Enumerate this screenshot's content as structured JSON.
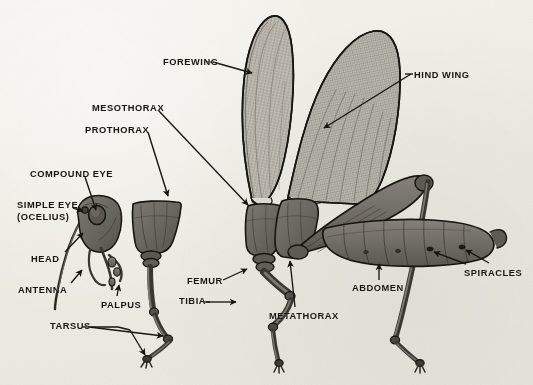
{
  "figure": {
    "kind": "anatomical-diagram",
    "style": "halftone black-and-white textbook plate",
    "background_color": "#f1efe8",
    "ink_color": "#17150f",
    "body_fill": "#6e6a63",
    "body_shadow": "#4a4741",
    "wing_fill": "#b9b6ad",
    "canvas": {
      "width": 533,
      "height": 385
    }
  },
  "labels": [
    {
      "id": "forewing",
      "text": "FOREWING",
      "x": 163,
      "y": 57,
      "lines": 1
    },
    {
      "id": "hind_wing",
      "text": "HIND WING",
      "x": 414,
      "y": 70,
      "lines": 1
    },
    {
      "id": "mesothorax",
      "text": "MESOTHORAX",
      "x": 92,
      "y": 103,
      "lines": 1
    },
    {
      "id": "prothorax",
      "text": "PROTHORAX",
      "x": 85,
      "y": 125,
      "lines": 1
    },
    {
      "id": "compound_eye",
      "text": "COMPOUND EYE",
      "x": 30,
      "y": 169,
      "lines": 1
    },
    {
      "id": "simple_eye",
      "text": "SIMPLE EYE\n(OCELIUS)",
      "x": 17,
      "y": 200,
      "lines": 2
    },
    {
      "id": "head",
      "text": "HEAD",
      "x": 31,
      "y": 254,
      "lines": 1
    },
    {
      "id": "antenna",
      "text": "ANTENNA",
      "x": 18,
      "y": 285,
      "lines": 1
    },
    {
      "id": "palpus",
      "text": "PALPUS",
      "x": 101,
      "y": 300,
      "lines": 1
    },
    {
      "id": "tarsus",
      "text": "TARSUS",
      "x": 50,
      "y": 325,
      "lines": 1
    },
    {
      "id": "femur",
      "text": "FEMUR",
      "x": 187,
      "y": 283,
      "lines": 1
    },
    {
      "id": "tibia",
      "text": "TIBIA",
      "x": 179,
      "y": 299,
      "lines": 1
    },
    {
      "id": "metathorax",
      "text": "METATHORAX",
      "x": 269,
      "y": 313,
      "lines": 1
    },
    {
      "id": "abdomen",
      "text": "ABDOMEN",
      "x": 352,
      "y": 285,
      "lines": 1
    },
    {
      "id": "spiracles",
      "text": "SPIRACLES",
      "x": 464,
      "y": 270,
      "lines": 1
    }
  ],
  "leaders": [
    {
      "id": "forewing-leader",
      "label": "forewing",
      "target": "forewing-blade"
    },
    {
      "id": "hind-wing-leader",
      "label": "hind_wing",
      "target": "hind-wing-blade"
    },
    {
      "id": "mesothorax-leader",
      "label": "mesothorax",
      "target": "mesothorax-segment"
    },
    {
      "id": "prothorax-leader",
      "label": "prothorax",
      "target": "prothorax-segment"
    },
    {
      "id": "compound-eye-leader",
      "label": "compound_eye",
      "target": "compound-eye"
    },
    {
      "id": "simple-eye-leader",
      "label": "simple_eye",
      "target": "simple-eye"
    },
    {
      "id": "head-leader",
      "label": "head",
      "target": "head-capsule"
    },
    {
      "id": "antenna-leader",
      "label": "antenna",
      "target": "antenna"
    },
    {
      "id": "palpus-leader",
      "label": "palpus",
      "target": "palpus"
    },
    {
      "id": "tarsus-leader-a",
      "label": "tarsus",
      "target": "foreleg-tarsus"
    },
    {
      "id": "tarsus-leader-b",
      "label": "tarsus",
      "target": "foreleg-claw"
    },
    {
      "id": "femur-leader",
      "label": "femur",
      "target": "midleg-femur"
    },
    {
      "id": "tibia-leader",
      "label": "tibia",
      "target": "midleg-tibia"
    },
    {
      "id": "metathorax-leader",
      "label": "metathorax",
      "target": "metathorax-segment"
    },
    {
      "id": "abdomen-leader",
      "label": "abdomen",
      "target": "abdomen-segments"
    },
    {
      "id": "spiracles-leader-a",
      "label": "spiracles",
      "target": "spiracle-front"
    },
    {
      "id": "spiracles-leader-b",
      "label": "spiracles",
      "target": "spiracle-rear"
    }
  ],
  "parts": [
    {
      "id": "head-capsule",
      "name": "head",
      "group": "head"
    },
    {
      "id": "compound-eye",
      "name": "compound eye",
      "group": "head"
    },
    {
      "id": "simple-eye",
      "name": "simple eye (ocellus)",
      "group": "head"
    },
    {
      "id": "antenna",
      "name": "antenna",
      "group": "head"
    },
    {
      "id": "palpus",
      "name": "palpus",
      "group": "head"
    },
    {
      "id": "prothorax-segment",
      "name": "prothorax",
      "group": "thorax"
    },
    {
      "id": "foreleg-tarsus",
      "name": "tarsus",
      "group": "foreleg"
    },
    {
      "id": "foreleg-claw",
      "name": "tarsal claw",
      "group": "foreleg"
    },
    {
      "id": "mesothorax-segment",
      "name": "mesothorax",
      "group": "thorax"
    },
    {
      "id": "forewing-blade",
      "name": "forewing",
      "group": "wings"
    },
    {
      "id": "midleg-femur",
      "name": "femur",
      "group": "midleg"
    },
    {
      "id": "midleg-tibia",
      "name": "tibia",
      "group": "midleg"
    },
    {
      "id": "metathorax-segment",
      "name": "metathorax",
      "group": "thorax"
    },
    {
      "id": "hind-wing-blade",
      "name": "hind wing",
      "group": "wings"
    },
    {
      "id": "abdomen-segments",
      "name": "abdomen",
      "group": "abdomen"
    },
    {
      "id": "spiracle-front",
      "name": "spiracle",
      "group": "abdomen"
    },
    {
      "id": "spiracle-rear",
      "name": "spiracle",
      "group": "abdomen"
    },
    {
      "id": "hind-leg-femur",
      "name": "hind femur",
      "group": "hindleg"
    },
    {
      "id": "hind-leg-tibia",
      "name": "hind tibia",
      "group": "hindleg"
    }
  ]
}
